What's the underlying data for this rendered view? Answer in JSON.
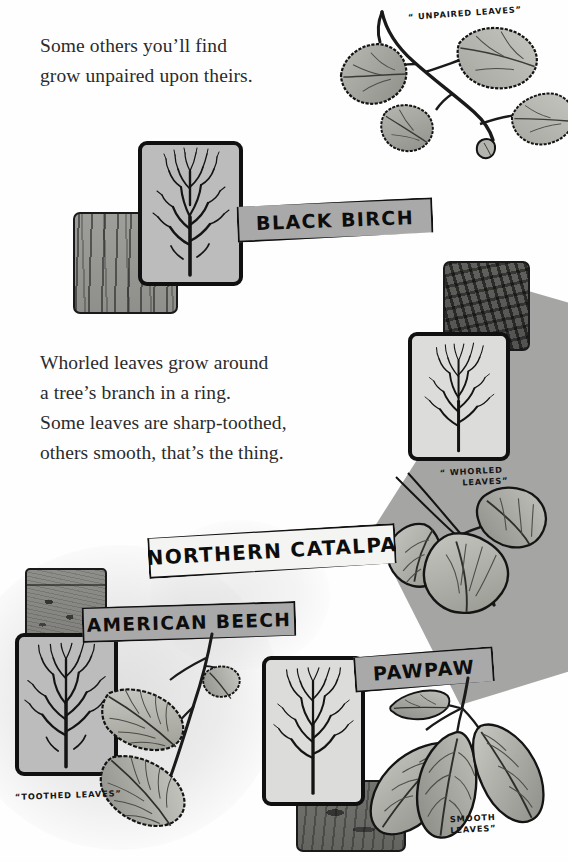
{
  "page": {
    "width": 568,
    "height": 862,
    "background_color": "#ffffff",
    "ink_color": "#111111",
    "sign_gray": "#a9a9a9",
    "sign_white": "#f4f4f2",
    "card_gray": "#bcbcbc",
    "polygon_gray": "#a5a5a3"
  },
  "verses": [
    {
      "id": "verse-unpaired",
      "lines": [
        "Some others you’ll find",
        "grow unpaired upon theirs."
      ]
    },
    {
      "id": "verse-whorled",
      "lines": [
        "Whorled leaves grow around",
        "a tree’s branch in a ring.",
        "Some leaves are sharp-toothed,",
        "others smooth, that’s the thing."
      ]
    }
  ],
  "signs": {
    "black_birch": "BLACK BIRCH",
    "northern_catalpa": "NORTHERN CATALPA",
    "american_beech": "AMERICAN BEECH",
    "pawpaw": "PAWPAW"
  },
  "callouts": {
    "unpaired": "“ UNPAIRED  LEAVES”",
    "whorled_line1": "“ WHORLED",
    "whorled_line2": "LEAVES”",
    "toothed": "“TOOTHED  LEAVES”",
    "smooth_line1": "SMOOTH",
    "smooth_line2": "LEAVES”"
  },
  "specimens": [
    {
      "name": "Black Birch",
      "leaf_arrangement": "unpaired",
      "leaf_margin": "toothed",
      "bark": "birch",
      "label": "BLACK BIRCH"
    },
    {
      "name": "Northern Catalpa",
      "leaf_arrangement": "whorled",
      "leaf_margin": "smooth",
      "bark": "rough",
      "label": "NORTHERN CATALPA"
    },
    {
      "name": "American Beech",
      "leaf_arrangement": "alternate",
      "leaf_margin": "toothed",
      "bark": "smooth",
      "label": "AMERICAN BEECH"
    },
    {
      "name": "Pawpaw",
      "leaf_arrangement": "alternate",
      "leaf_margin": "smooth",
      "bark": "mottled",
      "label": "PAWPAW"
    }
  ],
  "icons": {
    "tree_silhouette": "bare-deciduous-tree",
    "birch_leaf": "toothed-ovate-leaf",
    "catalpa_leaf": "heart-shaped-leaf",
    "beech_leaf": "serrated-elliptic-leaf",
    "pawpaw_leaf": "smooth-obovate-leaf"
  }
}
